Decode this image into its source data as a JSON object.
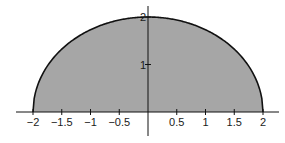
{
  "chart_data": {
    "type": "area",
    "title": "",
    "xlabel": "",
    "ylabel": "",
    "function": "y = sqrt(4 - x^2)",
    "x_domain": [
      -2,
      2
    ],
    "xlim": [
      -2.05,
      2.35
    ],
    "ylim": [
      -0.35,
      2.3
    ],
    "x_ticks": [
      -2,
      -1.5,
      -1,
      -0.5,
      0.5,
      1,
      1.5,
      2
    ],
    "x_tick_labels": [
      "−2",
      "−1.5",
      "−1",
      "−0.5",
      "0.5",
      "1",
      "1.5",
      "2"
    ],
    "y_ticks": [
      1,
      2
    ],
    "y_tick_labels": [
      "1",
      "2"
    ],
    "series": [
      {
        "name": "semicircle",
        "x": [
          -2,
          -1.75,
          -1.5,
          -1.25,
          -1,
          -0.75,
          -0.5,
          -0.25,
          0,
          0.25,
          0.5,
          0.75,
          1,
          1.25,
          1.5,
          1.75,
          2
        ],
        "y": [
          0,
          0.968,
          1.323,
          1.561,
          1.732,
          1.854,
          1.936,
          1.984,
          2,
          1.984,
          1.936,
          1.854,
          1.732,
          1.561,
          1.323,
          0.968,
          0
        ]
      }
    ],
    "fill_color": "#a6a6a6",
    "line_color": "#111111",
    "grid": false,
    "legend": "none"
  }
}
